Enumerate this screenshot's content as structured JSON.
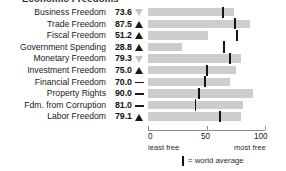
{
  "title": "Economic Freedoms",
  "axis": {
    "min_label": "0",
    "mid_label": "50",
    "max_label": "100",
    "least_free_label": "least free",
    "most_free_label": "most free"
  },
  "legend": {
    "marker_name": "world-average-marker",
    "text": "= world average"
  },
  "colors": {
    "bar": "#cdcdcd",
    "tick": "#151515",
    "axis": "#8f8f8f",
    "text": "#1a1a1a",
    "trend_up": "#1a1a1a",
    "trend_down": "#c2c2c2"
  },
  "chart_data": {
    "type": "bar",
    "orientation": "horizontal",
    "title": "Economic Freedoms",
    "xlabel": "",
    "ylabel": "",
    "xlim": [
      0,
      100
    ],
    "xticks": [
      0,
      50,
      100
    ],
    "grid": false,
    "legend_position": "bottom",
    "categories": [
      "Business Freedom",
      "Trade Freedom",
      "Fiscal Freedom",
      "Government Spending",
      "Monetary Freedom",
      "Investment Freedom",
      "Financial Freedom",
      "Property Rights",
      "Fdm. from Corruption",
      "Labor Freedom"
    ],
    "values": [
      73.6,
      87.5,
      51.2,
      28.8,
      79.3,
      75.0,
      70.0,
      90.0,
      81.0,
      79.1
    ],
    "series": [
      {
        "name": "Country score",
        "values": [
          73.6,
          87.5,
          51.2,
          28.8,
          79.3,
          75.0,
          70.0,
          90.0,
          81.0,
          79.1
        ]
      },
      {
        "name": "World average",
        "values": [
          64.3,
          74.6,
          76.3,
          64.7,
          70.2,
          50.2,
          49.0,
          43.6,
          40.5,
          61.5
        ]
      }
    ],
    "trends": [
      "down",
      "up",
      "up",
      "up",
      "down",
      "up",
      "flat",
      "flat",
      "flat",
      "up"
    ]
  },
  "rows": [
    {
      "label": "Business Freedom",
      "score": "73.6",
      "value": 73.6,
      "avg": 64.3,
      "trend": "down"
    },
    {
      "label": "Trade Freedom",
      "score": "87.5",
      "value": 87.5,
      "avg": 74.6,
      "trend": "up"
    },
    {
      "label": "Fiscal Freedom",
      "score": "51.2",
      "value": 51.2,
      "avg": 76.3,
      "trend": "up"
    },
    {
      "label": "Government Spending",
      "score": "28.8",
      "value": 28.8,
      "avg": 64.7,
      "trend": "up"
    },
    {
      "label": "Monetary Freedom",
      "score": "79.3",
      "value": 79.3,
      "avg": 70.2,
      "trend": "down"
    },
    {
      "label": "Investment Freedom",
      "score": "75.0",
      "value": 75.0,
      "avg": 50.2,
      "trend": "up"
    },
    {
      "label": "Financial Freedom",
      "score": "70.0",
      "value": 70.0,
      "avg": 49.0,
      "trend": "flat"
    },
    {
      "label": "Property Rights",
      "score": "90.0",
      "value": 90.0,
      "avg": 43.6,
      "trend": "flat"
    },
    {
      "label": "Fdm. from Corruption",
      "score": "81.0",
      "value": 81.0,
      "avg": 40.5,
      "trend": "flat"
    },
    {
      "label": "Labor Freedom",
      "score": "79.1",
      "value": 79.1,
      "avg": 61.5,
      "trend": "up"
    }
  ]
}
